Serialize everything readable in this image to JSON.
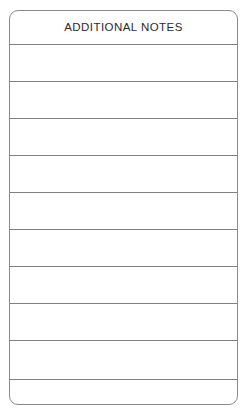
{
  "document": {
    "type": "form-section",
    "title": "ADDITIONAL NOTES",
    "background_color": "#ffffff",
    "border_color": "#8a8a8a",
    "rule_color": "#808080",
    "text_color": "#2b2b2b"
  },
  "form": {
    "header_label": "ADDITIONAL NOTES",
    "header_height_px": 33,
    "rule_count": 10,
    "rule_positions_px": [
      33,
      70,
      107,
      144,
      181,
      218,
      255,
      292,
      329,
      368
    ],
    "rows": [
      {
        "index": 1,
        "value": "",
        "placeholder": ""
      },
      {
        "index": 2,
        "value": "",
        "placeholder": ""
      },
      {
        "index": 3,
        "value": "",
        "placeholder": ""
      },
      {
        "index": 4,
        "value": "",
        "placeholder": ""
      },
      {
        "index": 5,
        "value": "",
        "placeholder": ""
      },
      {
        "index": 6,
        "value": "",
        "placeholder": ""
      },
      {
        "index": 7,
        "value": "",
        "placeholder": ""
      },
      {
        "index": 8,
        "value": "",
        "placeholder": ""
      },
      {
        "index": 9,
        "value": "",
        "placeholder": ""
      },
      {
        "index": 10,
        "value": "",
        "placeholder": ""
      },
      {
        "index": 11,
        "value": "",
        "placeholder": ""
      }
    ]
  }
}
